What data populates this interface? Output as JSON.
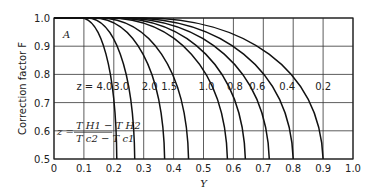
{
  "chart_data": {
    "type": "line",
    "title": "",
    "panel_label": "A",
    "xlabel": "Y",
    "ylabel": "Correction factor F",
    "xlim": [
      0,
      1.0
    ],
    "ylim": [
      0.5,
      1.0
    ],
    "grid": true,
    "x_ticks": [
      "0",
      "0.1",
      "0.2",
      "0.3",
      "0.4",
      "0.5",
      "0.6",
      "0.7",
      "0.8",
      "0.9",
      "1.0"
    ],
    "y_ticks": [
      "0.5",
      "0.6",
      "0.7",
      "0.8",
      "0.9",
      "1.0"
    ],
    "z_prefix": "z = ",
    "formula": {
      "lhs": "z =",
      "numerator": "T H1 − T H2",
      "denominator": "T c2 − T c1"
    },
    "series": [
      {
        "name": "4.0",
        "z": 4.0,
        "x_at_F1": 0.09,
        "x_at_F05": 0.21
      },
      {
        "name": "3.0",
        "z": 3.0,
        "x_at_F1": 0.11,
        "x_at_F05": 0.27
      },
      {
        "name": "2.0",
        "z": 2.0,
        "x_at_F1": 0.13,
        "x_at_F05": 0.37
      },
      {
        "name": "1.5",
        "z": 1.5,
        "x_at_F1": 0.15,
        "x_at_F05": 0.45
      },
      {
        "name": "1.0",
        "z": 1.0,
        "x_at_F1": 0.18,
        "x_at_F05": 0.58
      },
      {
        "name": "0.8",
        "z": 0.8,
        "x_at_F1": 0.2,
        "x_at_F05": 0.64
      },
      {
        "name": "0.6",
        "z": 0.6,
        "x_at_F1": 0.22,
        "x_at_F05": 0.72
      },
      {
        "name": "0.4",
        "z": 0.4,
        "x_at_F1": 0.25,
        "x_at_F05": 0.8
      },
      {
        "name": "0.2",
        "z": 0.2,
        "x_at_F1": 0.3,
        "x_at_F05": 0.9
      }
    ]
  }
}
